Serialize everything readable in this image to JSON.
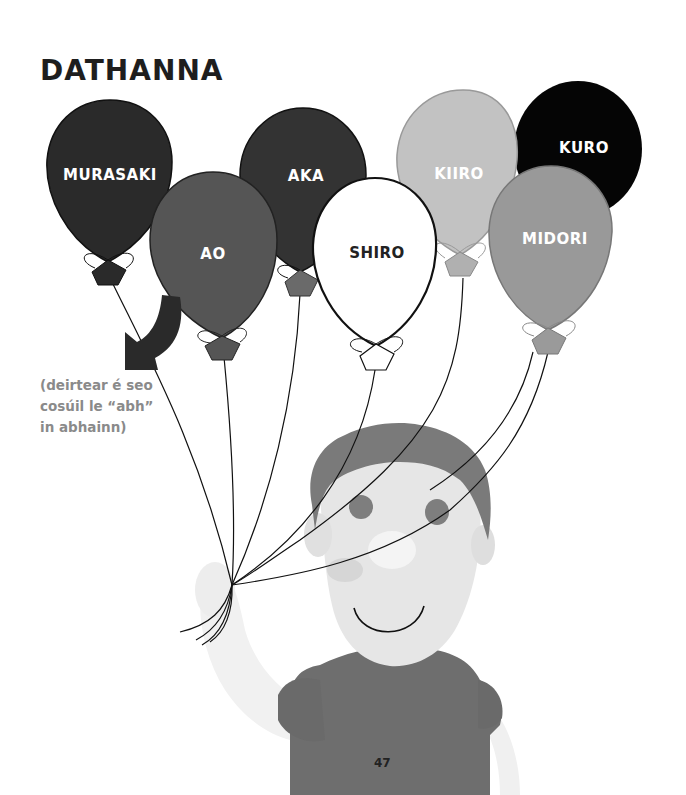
{
  "page": {
    "title": "DATHANNA",
    "caption_lines": [
      "(deirtear é seo",
      "cosúil le “abh”",
      "in abhainn)"
    ],
    "page_number": "47"
  },
  "balloons": [
    {
      "label": "MURASAKI",
      "fill": "#2a2a2a",
      "text_color": "#ffffff"
    },
    {
      "label": "AO",
      "fill": "#555555",
      "text_color": "#ffffff"
    },
    {
      "label": "AKA",
      "fill": "#333333",
      "text_color": "#ffffff"
    },
    {
      "label": "SHIRO",
      "fill": "#ffffff",
      "text_color": "#222222"
    },
    {
      "label": "KIIRO",
      "fill": "#c2c2c2",
      "text_color": "#ffffff"
    },
    {
      "label": "KURO",
      "fill": "#050505",
      "text_color": "#ffffff"
    },
    {
      "label": "MIDORI",
      "fill": "#999999",
      "text_color": "#ffffff"
    }
  ],
  "colors": {
    "arrow": "#2a2a2a",
    "caption": "#8a8a8a",
    "shirt": "#6e6e6e",
    "face": "#e6e6e6",
    "hair": "#7a7a7a"
  }
}
